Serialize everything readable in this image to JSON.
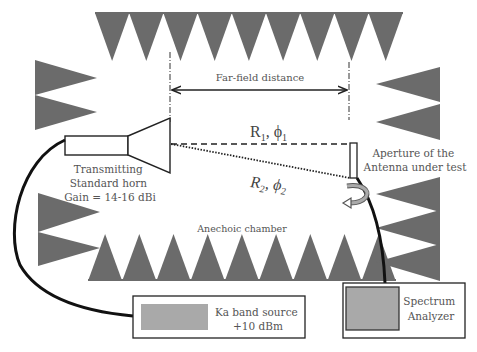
{
  "diagram": {
    "type": "anechoic-chamber-far-field-measurement-setup",
    "colors": {
      "absorber": "#6b6b6b",
      "text": "#555555",
      "line": "#222222",
      "instrument_fill": "#a9a9a9",
      "background": "#ffffff"
    },
    "labels": {
      "far_field": "Far-field distance",
      "ray1": {
        "main": "R",
        "sub1": "1",
        "sep": ", ",
        "phi": "ϕ",
        "sub2": "1"
      },
      "ray2": {
        "main": "R",
        "sub1": "2",
        "sep": ", ",
        "phi": "ϕ",
        "sub2": "2"
      },
      "horn": [
        "Transmitting",
        "Standard horn",
        "Gain = 14-16 dBi"
      ],
      "aut": [
        "Aperture of the",
        "Antenna under test"
      ],
      "chamber": "Anechoic chamber",
      "source": [
        "Ka band source",
        "+10 dBm"
      ],
      "analyzer": [
        "Spectrum",
        "Analyzer"
      ]
    },
    "components": [
      {
        "id": "transmitting-horn",
        "label": "Transmitting Standard horn",
        "gain": "14-16 dBi"
      },
      {
        "id": "antenna-under-test",
        "label": "Aperture of the Antenna under test"
      },
      {
        "id": "ka-band-source",
        "label": "Ka band source",
        "power": "+10 dBm"
      },
      {
        "id": "spectrum-analyzer",
        "label": "Spectrum Analyzer"
      }
    ],
    "absorbers": {
      "top_row_count": 9,
      "bottom_row_count": 9,
      "left_upper_count": 2,
      "left_lower_count": 2,
      "right_upper_count": 2,
      "right_lower_count": 3
    }
  }
}
